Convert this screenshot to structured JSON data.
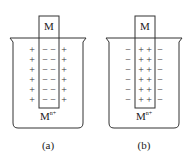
{
  "figure": {
    "panels": [
      {
        "id": "a",
        "caption": "(a)",
        "electrode_label": "M",
        "solution_label": "M",
        "solution_superscript": "n+",
        "electrode_charge": "−",
        "solution_charge": "+",
        "rows": 6
      },
      {
        "id": "b",
        "caption": "(b)",
        "electrode_label": "M",
        "solution_label": "M",
        "solution_superscript": "n+",
        "electrode_charge": "+",
        "solution_charge": "−",
        "rows": 6
      }
    ],
    "colors": {
      "stroke": "#333333",
      "text": "#222222",
      "background": "#ffffff"
    }
  }
}
